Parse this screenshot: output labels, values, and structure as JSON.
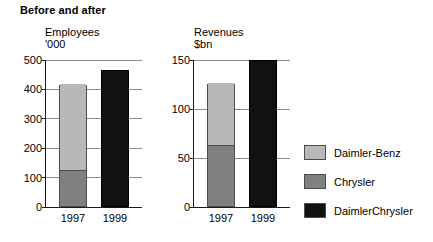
{
  "figure": {
    "title": "Before and after"
  },
  "chart_data": [
    {
      "type": "bar",
      "title": "Employees",
      "subtitle": "'000",
      "xlabel": "",
      "ylabel": "Employees '000",
      "categories": [
        "1997",
        "1999"
      ],
      "stacked": true,
      "ylim": [
        0,
        500
      ],
      "yticks": [
        0,
        100,
        200,
        300,
        400,
        500
      ],
      "ytick_labels": [
        "0",
        "100",
        "200",
        "300",
        "400",
        "500"
      ],
      "grid": true,
      "legend_position": "right",
      "series": [
        {
          "name": "Chrysler",
          "color": "#808080",
          "values": [
            124,
            0
          ]
        },
        {
          "name": "Daimler-Benz",
          "color": "#b8b8b8",
          "values": [
            291,
            0
          ]
        },
        {
          "name": "DaimlerChrysler",
          "color": "#111111",
          "values": [
            0,
            466
          ]
        }
      ],
      "totals": [
        415,
        466
      ]
    },
    {
      "type": "bar",
      "title": "Revenues",
      "subtitle": "$bn",
      "xlabel": "",
      "ylabel": "Revenues $bn",
      "categories": [
        "1997",
        "1999"
      ],
      "stacked": true,
      "ylim": [
        0,
        150
      ],
      "yticks": [
        0,
        50,
        100,
        150
      ],
      "ytick_labels": [
        "0",
        "50",
        "100",
        "150"
      ],
      "grid": true,
      "legend_position": "right",
      "series": [
        {
          "name": "Chrysler",
          "color": "#808080",
          "values": [
            62,
            0
          ]
        },
        {
          "name": "Daimler-Benz",
          "color": "#b8b8b8",
          "values": [
            64,
            0
          ]
        },
        {
          "name": "DaimlerChrysler",
          "color": "#111111",
          "values": [
            0,
            150
          ]
        }
      ],
      "totals": [
        126,
        150
      ]
    }
  ],
  "legend": {
    "items": [
      {
        "label": "Daimler-Benz",
        "color": "#b8b8b8"
      },
      {
        "label": "Chrysler",
        "color": "#808080"
      },
      {
        "label": "DaimlerChrysler",
        "color": "#111111"
      }
    ]
  }
}
